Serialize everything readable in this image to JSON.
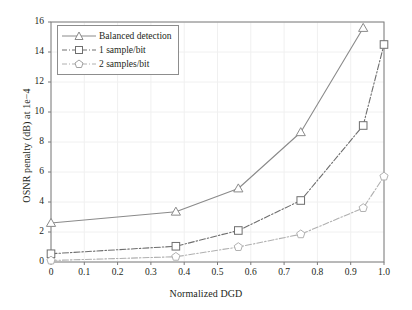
{
  "chart_data": {
    "type": "line",
    "title": "",
    "xlabel": "Normalized DGD",
    "ylabel": "OSNR penalty (dB) at 1e−4",
    "xlim": [
      0,
      1.0
    ],
    "ylim": [
      0,
      16
    ],
    "xticks": [
      "0",
      "0.1",
      "0.2",
      "0.3",
      "0.4",
      "0.5",
      "0.6",
      "0.7",
      "0.8",
      "0.9",
      "1.0"
    ],
    "xtick_values": [
      0,
      0.1,
      0.2,
      0.3,
      0.4,
      0.5,
      0.6,
      0.7,
      0.8,
      0.9,
      1.0
    ],
    "yticks": [
      "0",
      "2",
      "4",
      "6",
      "8",
      "10",
      "12",
      "14",
      "16"
    ],
    "ytick_values": [
      0,
      2,
      4,
      6,
      8,
      10,
      12,
      14,
      16
    ],
    "grid": true,
    "grid_color": "#f0f0f0",
    "axis_color": "#7b7b7b",
    "legend_position": "upper left",
    "series": [
      {
        "name": "Balanced detection",
        "marker": "triangle",
        "linestyle": "solid",
        "color": "#8a8a8a",
        "x": [
          0,
          0.375,
          0.5625,
          0.75,
          0.9375
        ],
        "y": [
          2.6,
          3.35,
          4.9,
          8.65,
          15.6
        ]
      },
      {
        "name": "1 sample/bit",
        "marker": "square",
        "linestyle": "dashdot",
        "color": "#6e6e6e",
        "x": [
          0,
          0.375,
          0.5625,
          0.75,
          0.9375,
          1.0
        ],
        "y": [
          0.55,
          1.05,
          2.1,
          4.1,
          9.1,
          14.5
        ]
      },
      {
        "name": "2 samples/bit",
        "marker": "pentagon",
        "linestyle": "dashdot",
        "color": "#b0b0b0",
        "x": [
          0,
          0.375,
          0.5625,
          0.75,
          0.9375,
          1.0
        ],
        "y": [
          0.1,
          0.35,
          1.0,
          1.85,
          3.6,
          5.7
        ]
      }
    ]
  },
  "legend": {
    "items": [
      {
        "label": "Balanced detection"
      },
      {
        "label": "1 sample/bit"
      },
      {
        "label": "2 samples/bit"
      }
    ]
  }
}
